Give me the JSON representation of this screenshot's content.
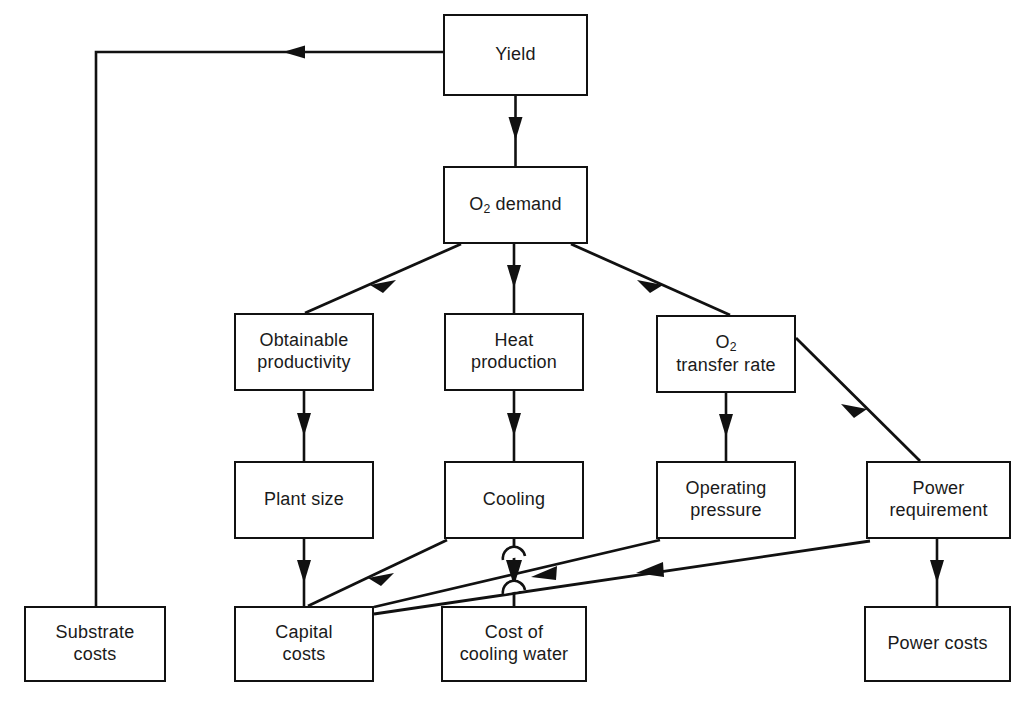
{
  "diagram": {
    "type": "flowchart",
    "background_color": "#ffffff",
    "line_color": "#111111",
    "box_fill": "#ffffff",
    "nodes": [
      {
        "id": "yield",
        "label": "Yield",
        "html": "Yield",
        "x": 443,
        "y": 14,
        "w": 145,
        "h": 82
      },
      {
        "id": "o2_demand",
        "label": "O2 demand",
        "html": "O<sub>2</sub> demand",
        "x": 443,
        "y": 166,
        "w": 145,
        "h": 78
      },
      {
        "id": "obtainable_prod",
        "label": "Obtainable productivity",
        "html": "Obtainable\nproductivity",
        "x": 234,
        "y": 313,
        "w": 140,
        "h": 78
      },
      {
        "id": "heat_production",
        "label": "Heat production",
        "html": "Heat\nproduction",
        "x": 444,
        "y": 313,
        "w": 140,
        "h": 78
      },
      {
        "id": "o2_transfer",
        "label": "O2 transfer rate",
        "html": "O<sub>2</sub>\ntransfer rate",
        "x": 656,
        "y": 315,
        "w": 140,
        "h": 78
      },
      {
        "id": "plant_size",
        "label": "Plant size",
        "html": "Plant size",
        "x": 234,
        "y": 461,
        "w": 140,
        "h": 78
      },
      {
        "id": "cooling",
        "label": "Cooling",
        "html": "Cooling",
        "x": 444,
        "y": 461,
        "w": 140,
        "h": 78
      },
      {
        "id": "operating_press",
        "label": "Operating pressure",
        "html": "Operating\npressure",
        "x": 656,
        "y": 461,
        "w": 140,
        "h": 78
      },
      {
        "id": "power_req",
        "label": "Power requirement",
        "html": "Power\nrequirement",
        "x": 866,
        "y": 461,
        "w": 145,
        "h": 78
      },
      {
        "id": "substrate_costs",
        "label": "Substrate costs",
        "html": "Substrate\ncosts",
        "x": 24,
        "y": 606,
        "w": 142,
        "h": 76
      },
      {
        "id": "capital_costs",
        "label": "Capital costs",
        "html": "Capital\ncosts",
        "x": 234,
        "y": 606,
        "w": 140,
        "h": 76
      },
      {
        "id": "cost_cooling",
        "label": "Cost of cooling water",
        "html": "Cost of\ncooling water",
        "x": 441,
        "y": 606,
        "w": 146,
        "h": 76
      },
      {
        "id": "power_costs",
        "label": "Power costs",
        "html": "Power costs",
        "x": 864,
        "y": 606,
        "w": 147,
        "h": 76
      }
    ],
    "edges": [
      {
        "id": "yield-to-substrate",
        "from": "yield",
        "to": "substrate_costs",
        "style": "orthogonal-left"
      },
      {
        "id": "yield-to-o2demand",
        "from": "yield",
        "to": "o2_demand",
        "style": "vertical"
      },
      {
        "id": "o2demand-to-obtainable",
        "from": "o2_demand",
        "to": "obtainable_prod",
        "style": "diagonal"
      },
      {
        "id": "o2demand-to-heat",
        "from": "o2_demand",
        "to": "heat_production",
        "style": "vertical"
      },
      {
        "id": "o2demand-to-o2transfer",
        "from": "o2_demand",
        "to": "o2_transfer",
        "style": "diagonal"
      },
      {
        "id": "obtainable-to-plantsize",
        "from": "obtainable_prod",
        "to": "plant_size",
        "style": "vertical"
      },
      {
        "id": "heat-to-cooling",
        "from": "heat_production",
        "to": "cooling",
        "style": "vertical"
      },
      {
        "id": "o2transfer-to-operating",
        "from": "o2_transfer",
        "to": "operating_press",
        "style": "vertical"
      },
      {
        "id": "o2transfer-to-power",
        "from": "o2_transfer",
        "to": "power_req",
        "style": "diagonal"
      },
      {
        "id": "plantsize-to-capital",
        "from": "plant_size",
        "to": "capital_costs",
        "style": "vertical"
      },
      {
        "id": "cooling-to-capital",
        "from": "cooling",
        "to": "capital_costs",
        "style": "diagonal"
      },
      {
        "id": "cooling-to-costcooling",
        "from": "cooling",
        "to": "cost_cooling",
        "style": "vertical-with-hops"
      },
      {
        "id": "operating-to-capital",
        "from": "operating_press",
        "to": "capital_costs",
        "style": "diagonal"
      },
      {
        "id": "power-to-capital",
        "from": "power_req",
        "to": "capital_costs",
        "style": "diagonal"
      },
      {
        "id": "power-to-powercosts",
        "from": "power_req",
        "to": "power_costs",
        "style": "vertical"
      }
    ]
  }
}
